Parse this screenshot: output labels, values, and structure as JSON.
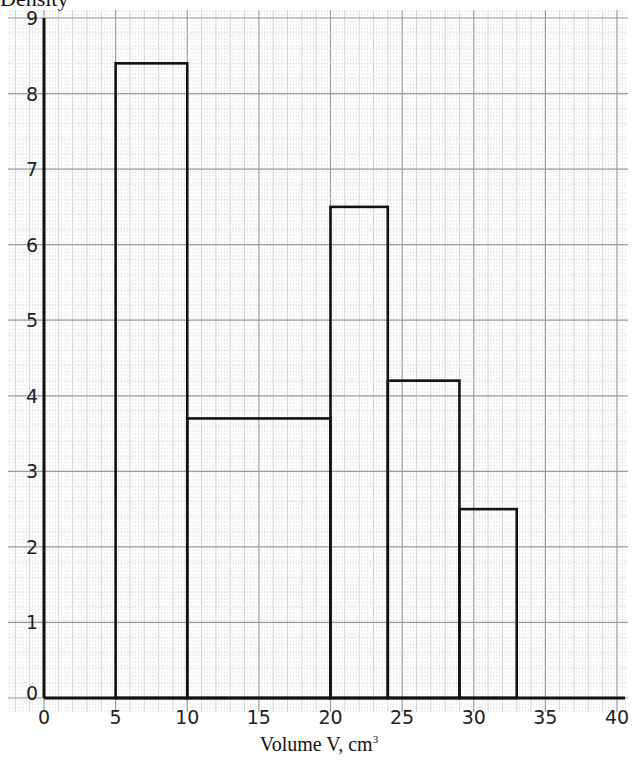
{
  "chart_data": {
    "type": "bar",
    "subtype": "histogram",
    "title": "",
    "ylabel": "Density",
    "xlabel": "Volume V, cm",
    "xlabel_superscript": "3",
    "xlim": [
      0,
      40
    ],
    "ylim": [
      0,
      9
    ],
    "xticks": [
      0,
      5,
      10,
      15,
      20,
      25,
      30,
      35,
      40
    ],
    "yticks": [
      0,
      1,
      2,
      3,
      4,
      5,
      6,
      7,
      8,
      9
    ],
    "grid": true,
    "bins": [
      {
        "x0": 5,
        "x1": 10,
        "density": 8.4
      },
      {
        "x0": 10,
        "x1": 20,
        "density": 3.7
      },
      {
        "x0": 20,
        "x1": 24,
        "density": 6.5
      },
      {
        "x0": 24,
        "x1": 29,
        "density": 4.2
      },
      {
        "x0": 29,
        "x1": 33,
        "density": 2.5
      }
    ],
    "categories": [
      "5-10",
      "10-20",
      "20-24",
      "24-29",
      "29-33"
    ],
    "values": [
      8.4,
      3.7,
      6.5,
      4.2,
      2.5
    ]
  }
}
